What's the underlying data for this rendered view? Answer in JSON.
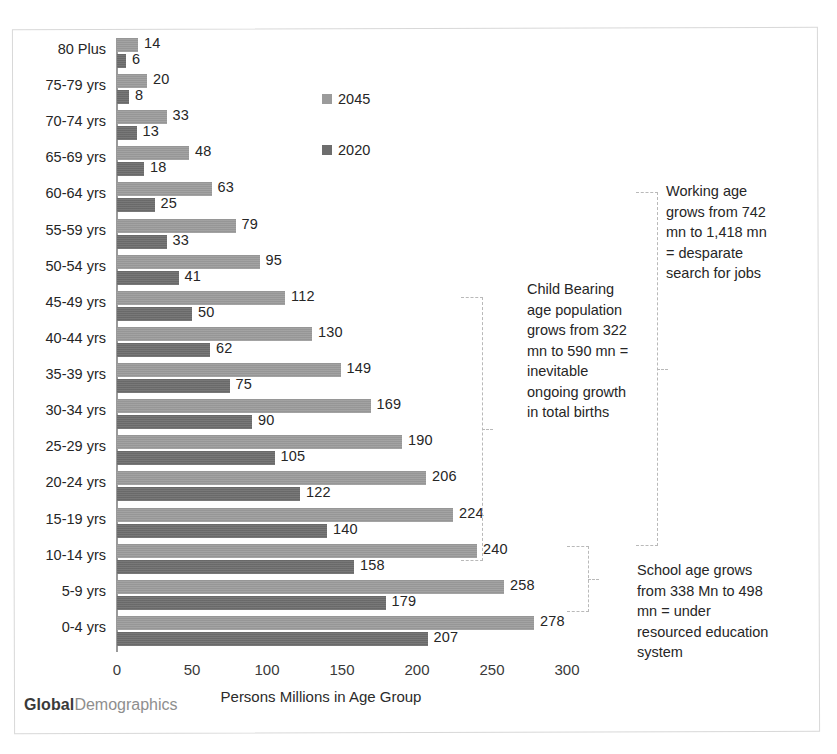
{
  "chart_data": {
    "type": "bar",
    "orientation": "horizontal",
    "title": "",
    "xlabel": "Persons Millions in Age Group",
    "ylabel": "",
    "xlim": [
      0,
      300
    ],
    "xticks": [
      0,
      50,
      100,
      150,
      200,
      250,
      300
    ],
    "grid": false,
    "legend_position": "inside-top-center",
    "categories": [
      "80 Plus",
      "75-79 yrs",
      "70-74 yrs",
      "65-69 yrs",
      "60-64 yrs",
      "55-59 yrs",
      "50-54 yrs",
      "45-49 yrs",
      "40-44 yrs",
      "35-39 yrs",
      "30-34 yrs",
      "25-29 yrs",
      "20-24 yrs",
      "15-19 yrs",
      "10-14 yrs",
      "5-9 yrs",
      "0-4 yrs"
    ],
    "series": [
      {
        "name": "2045",
        "color": "#9b9b9b",
        "values": [
          14,
          20,
          33,
          48,
          63,
          79,
          95,
          112,
          130,
          149,
          169,
          190,
          206,
          224,
          240,
          258,
          278
        ]
      },
      {
        "name": "2020",
        "color": "#6d6d6d",
        "values": [
          6,
          8,
          13,
          18,
          25,
          33,
          41,
          50,
          62,
          75,
          90,
          105,
          122,
          140,
          158,
          179,
          207
        ]
      }
    ]
  },
  "legend": {
    "items": [
      {
        "label": "2045",
        "color": "#9b9b9b"
      },
      {
        "label": "2020",
        "color": "#6d6d6d"
      }
    ]
  },
  "annotations": [
    {
      "id": "child-bearing",
      "text": "Child Bearing age population grows from 322 mn to 590 mn = inevitable ongoing growth in total births",
      "covers": "15-19 yrs to 45-49 yrs"
    },
    {
      "id": "working-age",
      "text": "Working age grows from 742 mn to 1,418 mn = desparate search for jobs",
      "covers": "15-19 yrs to 60-64 yrs"
    },
    {
      "id": "school-age",
      "text": "School age grows from 338 Mn to 498 mn = under resourced education system",
      "covers": "5-9 yrs to 10-14 yrs"
    }
  ],
  "brand": {
    "bold_part": "Global",
    "light_part": "Demographics"
  }
}
